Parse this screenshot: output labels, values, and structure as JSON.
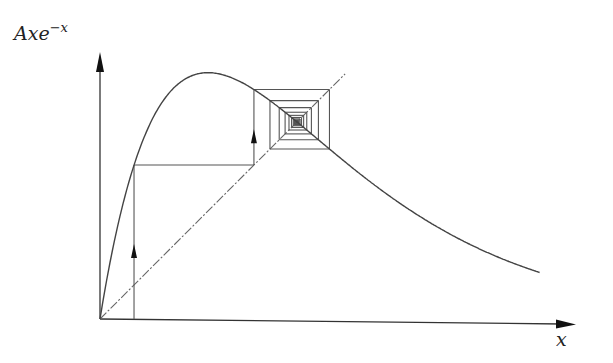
{
  "figure": {
    "y_axis_label": "Axe",
    "y_axis_label_sup": "−x",
    "x_axis_label": "x",
    "function": "A x e^{-x}",
    "parameters": {
      "A": 6.2
    },
    "x_range": [
      0,
      4.07
    ],
    "initial_x": 0.315,
    "cobweb_iterations": 40,
    "colors": {
      "curve": "#444444",
      "axis": "#333333",
      "cobweb": "#555555",
      "diagonal": "#666666"
    }
  },
  "layout": {
    "origin_px": [
      100,
      319
    ],
    "scale_px_per_unit": 108,
    "y_axis_top_px": 52,
    "x_axis_end_px": 576
  }
}
